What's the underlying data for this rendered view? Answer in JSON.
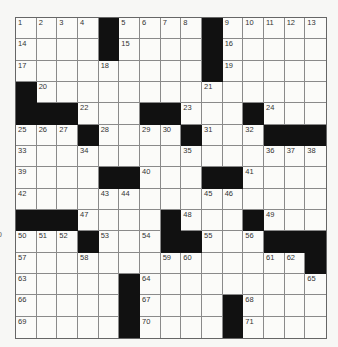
{
  "puzzle": {
    "rows": 15,
    "cols": 15,
    "edge_fragment": "o",
    "colors": {
      "block": "#111111",
      "cell": "#fbfbf9",
      "line": "#8a8a8a",
      "number": "#333333"
    },
    "grid": [
      [
        "1",
        "2",
        "3",
        "4",
        "#",
        "5",
        "6",
        "7",
        "8",
        "#",
        "9",
        "10",
        "11",
        "12",
        "13"
      ],
      [
        "14",
        "",
        "",
        "",
        "#",
        "15",
        "",
        "",
        "",
        "#",
        "16",
        "",
        "",
        "",
        ""
      ],
      [
        "17",
        "",
        "",
        "",
        "18",
        "",
        "",
        "",
        "",
        "#",
        "19",
        "",
        "",
        "",
        ""
      ],
      [
        "#",
        "20",
        "",
        "",
        "",
        "",
        "",
        "",
        "",
        "21",
        "",
        "",
        "",
        "",
        ""
      ],
      [
        "#",
        "#",
        "#",
        "22",
        "",
        "",
        "#",
        "#",
        "23",
        "",
        "",
        "#",
        "24",
        "",
        ""
      ],
      [
        "25",
        "26",
        "27",
        "#",
        "28",
        "",
        "29",
        "30",
        "#",
        "31",
        "",
        "32",
        "#",
        "#",
        "#"
      ],
      [
        "33",
        "",
        "",
        "34",
        "",
        "",
        "",
        "",
        "35",
        "",
        "",
        "",
        "36",
        "37",
        "38"
      ],
      [
        "39",
        "",
        "",
        "",
        "#",
        "#",
        "40",
        "",
        "",
        "#",
        "#",
        "41",
        "",
        "",
        ""
      ],
      [
        "42",
        "",
        "",
        "",
        "43",
        "44",
        "",
        "",
        "",
        "45",
        "46",
        "",
        "",
        "",
        ""
      ],
      [
        "#",
        "#",
        "#",
        "47",
        "",
        "",
        "",
        "#",
        "48",
        "",
        "",
        "#",
        "49",
        "",
        ""
      ],
      [
        "50",
        "51",
        "52",
        "#",
        "53",
        "",
        "54",
        "#",
        "#",
        "55",
        "",
        "56",
        "#",
        "#",
        "#"
      ],
      [
        "57",
        "",
        "",
        "58",
        "",
        "",
        "",
        "59",
        "60",
        "",
        "",
        "",
        "61",
        "62",
        "#"
      ],
      [
        "63",
        "",
        "",
        "",
        "",
        "#",
        "64",
        "",
        "",
        "",
        "",
        "",
        "",
        "",
        "65"
      ],
      [
        "66",
        "",
        "",
        "",
        "",
        "#",
        "67",
        "",
        "",
        "",
        "#",
        "68",
        "",
        "",
        ""
      ],
      [
        "69",
        "",
        "",
        "",
        "",
        "#",
        "70",
        "",
        "",
        "",
        "#",
        "71",
        "",
        "",
        ""
      ]
    ]
  }
}
